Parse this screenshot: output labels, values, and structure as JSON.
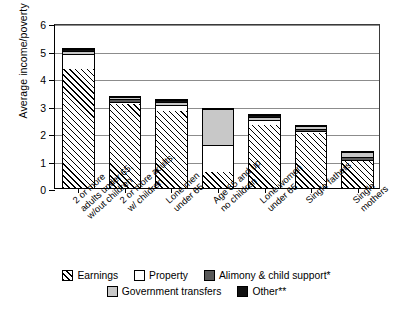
{
  "chart_data": {
    "type": "bar",
    "subtype": "stacked-bar",
    "title": "",
    "xlabel": "",
    "ylabel": "Average income/poverty line",
    "ylim": [
      0,
      6
    ],
    "yticks": [
      0,
      1,
      2,
      3,
      4,
      5,
      6
    ],
    "ytick_labels": [
      "0",
      "1",
      "2",
      "3",
      "4",
      "5",
      "6"
    ],
    "grid": "horizontal",
    "legend_position": "bottom",
    "categories": [
      "2 or more\nadults under 65,\nw/out children",
      "2 or more adults,\nw/ children",
      "Lone men\nunder 65",
      "Age 65 and up\nno children",
      "Lone women\nunder 65",
      "Single fathers",
      "Single mothers"
    ],
    "series": [
      {
        "name": "Earnings",
        "values": [
          4.35,
          3.08,
          2.85,
          0.6,
          2.33,
          2.05,
          1.0
        ]
      },
      {
        "name": "Property",
        "values": [
          0.55,
          0.1,
          0.2,
          1.0,
          0.17,
          0.05,
          0.03
        ]
      },
      {
        "name": "Alimony & child support*",
        "values": [
          0.0,
          0.08,
          0.0,
          0.0,
          0.0,
          0.08,
          0.13
        ]
      },
      {
        "name": "Government transfers",
        "values": [
          0.12,
          0.09,
          0.12,
          1.32,
          0.12,
          0.1,
          0.19
        ]
      },
      {
        "name": "Other**",
        "values": [
          0.08,
          0.0,
          0.08,
          0.0,
          0.08,
          0.0,
          0.0
        ]
      }
    ],
    "totals": [
      5.1,
      3.35,
      3.25,
      2.92,
      2.7,
      2.28,
      1.35
    ]
  },
  "legend": {
    "row1": [
      {
        "label": "Earnings",
        "swatch": "hatched-diagonal",
        "color": "#ffffff"
      },
      {
        "label": "Property",
        "swatch": "solid",
        "color": "#ffffff"
      },
      {
        "label": "Alimony & child support*",
        "swatch": "solid",
        "color": "#595959"
      }
    ],
    "row2": [
      {
        "label": "Government transfers",
        "swatch": "solid",
        "color": "#c8c8c8"
      },
      {
        "label": "Other**",
        "swatch": "solid",
        "color": "#111111"
      }
    ]
  }
}
